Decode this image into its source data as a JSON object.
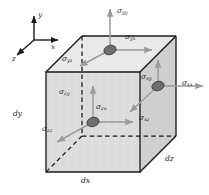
{
  "figure": {
    "type": "stress-element-cube",
    "background_color": "#ffffff",
    "line_color": "#1a1a1a",
    "face_fill_front": "#d9d9d9",
    "face_fill_top": "#e8e8e8",
    "face_fill_right": "#c9c9c9",
    "arrow_color": "#9a9a9a",
    "hub_color": "#6e6e6e",
    "hidden_edge_style": "dashed"
  },
  "axes": {
    "label_y": "y",
    "label_x": "x",
    "label_z": "z",
    "origin_note": "triad at upper-left",
    "directions": {
      "y": "up",
      "x": "right",
      "z": "down-left"
    }
  },
  "dimensions": {
    "dx": "dx",
    "dy": "dy",
    "dz": "dz"
  },
  "sigma": "σ",
  "stresses": [
    {
      "id": "sigma-yy",
      "base": "σ",
      "sub": "yy",
      "face": "top",
      "kind": "normal",
      "arrow": "up"
    },
    {
      "id": "sigma-yx",
      "base": "σ",
      "sub": "yx",
      "face": "top",
      "kind": "shear",
      "arrow": "right"
    },
    {
      "id": "sigma-yz",
      "base": "σ",
      "sub": "yz",
      "face": "top",
      "kind": "shear",
      "arrow": "down-left"
    },
    {
      "id": "sigma-xx",
      "base": "σ",
      "sub": "xx",
      "face": "right",
      "kind": "normal",
      "arrow": "right"
    },
    {
      "id": "sigma-xy",
      "base": "σ",
      "sub": "xy",
      "face": "right",
      "kind": "shear",
      "arrow": "up"
    },
    {
      "id": "sigma-xz",
      "base": "σ",
      "sub": "xz",
      "face": "right",
      "kind": "shear",
      "arrow": "down-left"
    },
    {
      "id": "sigma-zz",
      "base": "σ",
      "sub": "zz",
      "face": "front",
      "kind": "normal",
      "arrow": "down-left"
    },
    {
      "id": "sigma-zy",
      "base": "σ",
      "sub": "zy",
      "face": "front",
      "kind": "shear",
      "arrow": "up"
    },
    {
      "id": "sigma-zx",
      "base": "σ",
      "sub": "zx",
      "face": "front",
      "kind": "shear",
      "arrow": "right"
    }
  ]
}
